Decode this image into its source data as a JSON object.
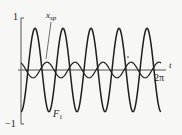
{
  "chart_data": {
    "type": "line",
    "title": "",
    "xlabel": "t",
    "ylabel": "",
    "xlim": [
      0,
      6.2832
    ],
    "ylim": [
      -1,
      1
    ],
    "grid": false,
    "legend": "inline labels",
    "x_tick_labels": [
      "2π"
    ],
    "y_tick_labels": [
      "1",
      "-1"
    ],
    "series": [
      {
        "name": "F1",
        "label": "F",
        "label_sub": "1",
        "formula_estimate": "-0.8*cos(5t)",
        "amplitude": 0.8,
        "periods_over_range": 5,
        "x": [
          0,
          0.3142,
          0.6283,
          0.9425,
          1.2566,
          1.5708,
          1.885,
          2.1991,
          2.5133,
          2.8274,
          3.1416,
          3.4558,
          3.7699,
          4.0841,
          4.3982,
          4.7124,
          5.0265,
          5.3407,
          5.6549,
          5.969,
          6.2832
        ],
        "values": [
          -0.8,
          0,
          0.8,
          0,
          -0.8,
          0,
          0.8,
          0,
          -0.8,
          0,
          0.8,
          0,
          -0.8,
          0,
          0.8,
          0,
          -0.8,
          0,
          0.8,
          0,
          -0.8
        ]
      },
      {
        "name": "x_sp",
        "label": "x",
        "label_sub": "sp",
        "formula_estimate": "0.15*cos(5t+0.44)",
        "amplitude": 0.15,
        "periods_over_range": 5,
        "x": [
          0,
          0.3142,
          0.6283,
          0.9425,
          1.2566,
          1.5708,
          1.885,
          2.1991,
          2.5133,
          2.8274,
          3.1416,
          3.4558,
          3.7699,
          4.0841,
          4.3982,
          4.7124,
          5.0265,
          5.3407,
          5.6549,
          5.969,
          6.2832
        ],
        "values": [
          0.14,
          -0.06,
          -0.14,
          0.06,
          0.14,
          -0.06,
          -0.14,
          0.06,
          0.14,
          -0.06,
          -0.14,
          0.06,
          0.14,
          -0.06,
          -0.14,
          0.06,
          0.14,
          -0.06,
          -0.14,
          0.06,
          0.14
        ]
      }
    ],
    "colors": {
      "curve": "#1e1e1e",
      "axis": "#555555",
      "background": "#f7f7f5"
    }
  },
  "labels": {
    "y_top": "1",
    "y_bottom": "−1",
    "x_axis": "t",
    "x_end": "2π",
    "series_xsp_main": "x",
    "series_xsp_sub": "sp",
    "series_f1_main": "F",
    "series_f1_sub": "1"
  }
}
